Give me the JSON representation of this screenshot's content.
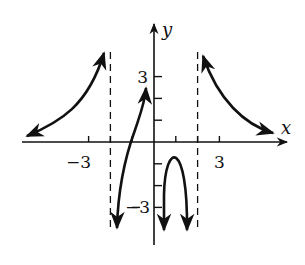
{
  "chart_data": {
    "type": "line",
    "title": "",
    "xlabel": "x",
    "ylabel": "y",
    "xlim": [
      -7,
      7
    ],
    "ylim": [
      -4.5,
      5
    ],
    "grid": false,
    "tick_step": 1,
    "x_tick_labels": [
      {
        "value": -3,
        "label": "−3"
      },
      {
        "value": 3,
        "label": "3"
      }
    ],
    "y_tick_labels": [
      {
        "value": 3,
        "label": "3"
      },
      {
        "value": -3,
        "label": "−3"
      }
    ],
    "asymptotes": [
      {
        "type": "vertical",
        "x": -2,
        "style": "dashed"
      },
      {
        "type": "vertical",
        "x": 2,
        "style": "dashed"
      }
    ],
    "series": [
      {
        "name": "left branch",
        "description": "increasing to +infinity as x approaches -2 from left; approaches y=0.5 as x to -infinity",
        "x": [
          -5.8,
          -5,
          -4,
          -3,
          -2.5,
          -2.1
        ],
        "y": [
          0.5,
          0.9,
          1.5,
          2.6,
          3.5,
          4.2
        ]
      },
      {
        "name": "middle-left branch",
        "description": "increasing from -infinity near x=-2 through x-intercept near -1 up to about y=2.6 at x=-0.3",
        "x": [
          -1.8,
          -1.5,
          -1,
          -0.6,
          -0.3
        ],
        "y": [
          -3.5,
          -1.5,
          0,
          1.2,
          2.6
        ]
      },
      {
        "name": "middle-right branch",
        "description": "downward arch between x=0.5 and x=1.5 with max near (1, -1)",
        "x": [
          0.5,
          0.6,
          1,
          1.4,
          1.5
        ],
        "y": [
          -3.5,
          -2,
          -1,
          -2,
          -3.5
        ]
      },
      {
        "name": "right branch",
        "description": "decreasing from +infinity near x=2 toward y=0.5 as x to +infinity",
        "x": [
          2.1,
          2.5,
          3,
          4,
          5,
          5.8
        ],
        "y": [
          4.2,
          3.3,
          2.4,
          1.3,
          0.8,
          0.5
        ]
      }
    ]
  }
}
